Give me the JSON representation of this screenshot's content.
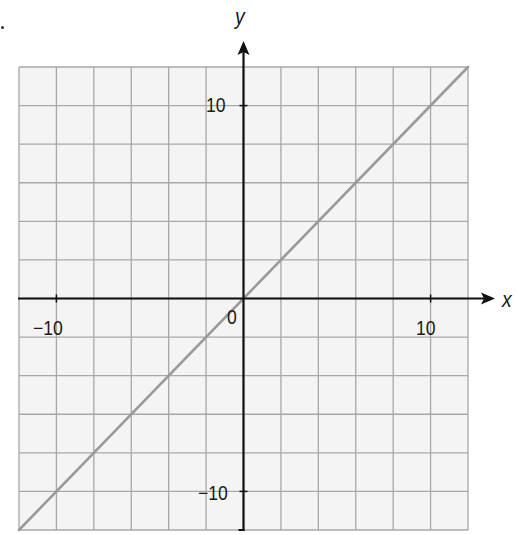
{
  "chart_data": {
    "type": "line",
    "title": "",
    "xlabel": "x",
    "ylabel": "y",
    "xlim": [
      -12,
      12
    ],
    "ylim": [
      -12,
      12
    ],
    "grid": true,
    "grid_step": 2,
    "x_tick_labels": [
      "-10",
      "10"
    ],
    "y_tick_labels": [
      "10",
      "-10"
    ],
    "origin_label": "0",
    "series": [
      {
        "name": "y = x",
        "x": [
          -12,
          12
        ],
        "y": [
          -12,
          12
        ]
      }
    ],
    "legend": null
  },
  "labels": {
    "x_axis": "x",
    "y_axis": "y",
    "origin": "0",
    "x_neg": "−10",
    "x_pos": "10",
    "y_pos": "10",
    "y_neg": "−10"
  },
  "colors": {
    "grid_line": "#a8a8a8",
    "grid_fill": "#f4f4f4",
    "axis": "#111111",
    "series_line": "#9a9a9a"
  }
}
